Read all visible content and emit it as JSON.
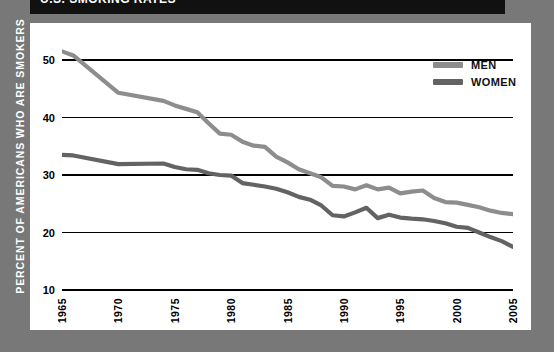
{
  "banner": {
    "title": "U.S. SMOKING RATES"
  },
  "axis": {
    "ylabel": "PERCENT OF AMERICANS WHO ARE SMOKERS"
  },
  "legend": {
    "position": "top-right",
    "entries": [
      {
        "label": "MEN",
        "color": "#8d8d8d"
      },
      {
        "label": "WOMEN",
        "color": "#636363"
      }
    ]
  },
  "colors": {
    "background": "#787878",
    "panel": "#ffffff",
    "banner": "#111111",
    "gridline": "#000000",
    "men": "#8d8d8d",
    "women": "#636363"
  },
  "chart_data": {
    "type": "line",
    "title": "U.S. SMOKING RATES",
    "xlabel": "",
    "ylabel": "PERCENT OF AMERICANS WHO ARE SMOKERS",
    "xlim": [
      1965,
      2005
    ],
    "ylim": [
      10,
      54
    ],
    "yticks": [
      10,
      20,
      30,
      40,
      50
    ],
    "xticks": [
      1965,
      1970,
      1975,
      1980,
      1985,
      1990,
      1995,
      2000,
      2005
    ],
    "grid": true,
    "x": [
      1965,
      1966,
      1970,
      1974,
      1975,
      1976,
      1977,
      1978,
      1979,
      1980,
      1981,
      1982,
      1983,
      1984,
      1985,
      1986,
      1987,
      1988,
      1989,
      1990,
      1991,
      1992,
      1993,
      1994,
      1995,
      1996,
      1997,
      1998,
      1999,
      2000,
      2001,
      2002,
      2003,
      2004,
      2005
    ],
    "series": [
      {
        "name": "MEN",
        "color": "#8d8d8d",
        "values": [
          51.5,
          50.8,
          44.3,
          42.9,
          42.1,
          41.5,
          40.9,
          39.0,
          37.2,
          37.0,
          35.8,
          35.1,
          34.9,
          33.2,
          32.2,
          31.0,
          30.3,
          29.6,
          28.1,
          28.0,
          27.5,
          28.2,
          27.5,
          27.8,
          26.8,
          27.1,
          27.3,
          26.0,
          25.3,
          25.2,
          24.8,
          24.4,
          23.8,
          23.4,
          23.2
        ]
      },
      {
        "name": "WOMEN",
        "color": "#636363",
        "values": [
          33.5,
          33.4,
          31.9,
          32.0,
          31.4,
          31.0,
          30.9,
          30.3,
          30.0,
          29.9,
          28.6,
          28.3,
          28.0,
          27.6,
          27.0,
          26.2,
          25.7,
          24.7,
          23.0,
          22.8,
          23.5,
          24.3,
          22.5,
          23.1,
          22.6,
          22.4,
          22.3,
          22.0,
          21.6,
          21.0,
          20.8,
          20.0,
          19.2,
          18.5,
          17.5
        ]
      }
    ]
  }
}
